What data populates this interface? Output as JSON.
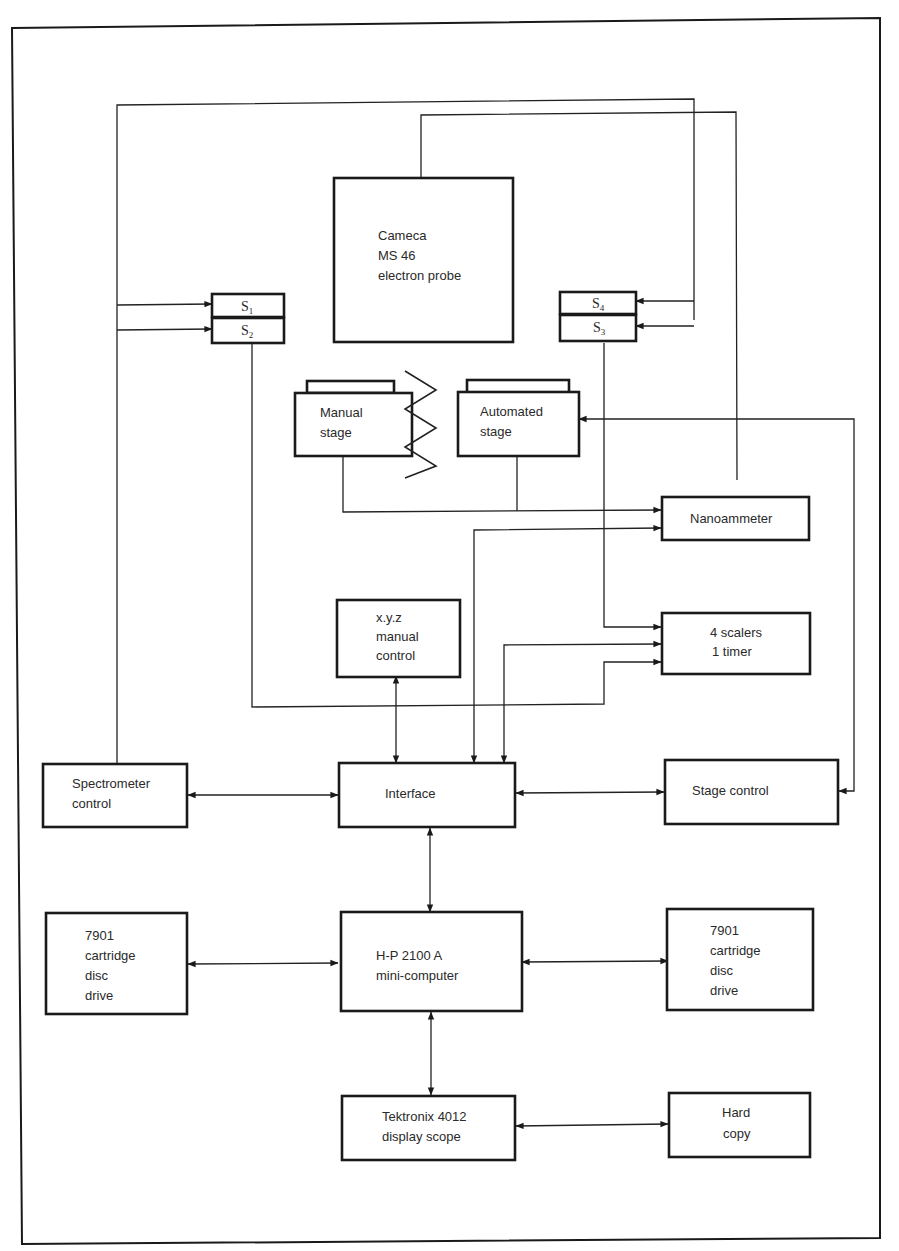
{
  "diagram": {
    "type": "block-diagram",
    "colors": {
      "ink": "#1a1a1a",
      "paper": "#ffffff"
    },
    "nodes": {
      "probe": {
        "lines": [
          "Cameca",
          "MS 46",
          "electron probe"
        ]
      },
      "s1": {
        "letter": "S",
        "index": "1"
      },
      "s2": {
        "letter": "S",
        "index": "2"
      },
      "s3": {
        "letter": "S",
        "index": "3"
      },
      "s4": {
        "letter": "S",
        "index": "4"
      },
      "manual_stage": {
        "lines": [
          "Manual",
          "stage"
        ]
      },
      "automated_stage": {
        "lines": [
          "Automated",
          "stage"
        ]
      },
      "nanoammeter": {
        "lines": [
          "Nanoammeter"
        ]
      },
      "xyz_control": {
        "lines": [
          "x.y.z",
          "manual",
          "control"
        ]
      },
      "scalers": {
        "lines": [
          "4 scalers",
          "1 timer"
        ]
      },
      "spectrometer_control": {
        "lines": [
          "Spectrometer",
          "control"
        ]
      },
      "interface": {
        "lines": [
          "Interface"
        ]
      },
      "stage_control": {
        "lines": [
          "Stage control"
        ]
      },
      "disc_left": {
        "lines": [
          "7901",
          "cartridge",
          "disc",
          "drive"
        ]
      },
      "computer": {
        "lines": [
          "H-P 2100 A",
          "mini-computer"
        ]
      },
      "disc_right": {
        "lines": [
          "7901",
          "cartridge",
          "disc",
          "drive"
        ]
      },
      "tektronix": {
        "lines": [
          "Tektronix 4012",
          "display scope"
        ]
      },
      "hard_copy": {
        "lines": [
          "Hard",
          "copy"
        ]
      }
    },
    "edges": [
      {
        "from": "spectrometer_control",
        "to": "s1",
        "arrow": "to"
      },
      {
        "from": "spectrometer_control",
        "to": "s2",
        "arrow": "to"
      },
      {
        "from": "spectrometer_control",
        "to": "s4",
        "arrow": "to"
      },
      {
        "from": "spectrometer_control",
        "to": "s3",
        "arrow": "to"
      },
      {
        "from": "s2",
        "to": "scalers",
        "arrow": "to"
      },
      {
        "from": "s3",
        "to": "scalers",
        "arrow": "to"
      },
      {
        "from": "probe",
        "to": "nanoammeter",
        "arrow": "none"
      },
      {
        "from": "manual_stage",
        "to": "nanoammeter",
        "arrow": "to"
      },
      {
        "from": "automated_stage",
        "to": "nanoammeter",
        "arrow": "to"
      },
      {
        "from": "interface",
        "to": "nanoammeter",
        "arrow": "both"
      },
      {
        "from": "interface",
        "to": "scalers",
        "arrow": "both"
      },
      {
        "from": "xyz_control",
        "to": "interface",
        "arrow": "both"
      },
      {
        "from": "stage_control",
        "to": "automated_stage",
        "arrow": "both"
      },
      {
        "from": "spectrometer_control",
        "to": "interface",
        "arrow": "both"
      },
      {
        "from": "interface",
        "to": "stage_control",
        "arrow": "both"
      },
      {
        "from": "interface",
        "to": "computer",
        "arrow": "both"
      },
      {
        "from": "disc_left",
        "to": "computer",
        "arrow": "both"
      },
      {
        "from": "computer",
        "to": "disc_right",
        "arrow": "both"
      },
      {
        "from": "computer",
        "to": "tektronix",
        "arrow": "both"
      },
      {
        "from": "tektronix",
        "to": "hard_copy",
        "arrow": "both"
      }
    ]
  }
}
